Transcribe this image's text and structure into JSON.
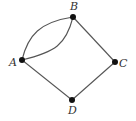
{
  "graph": {
    "nodes": [
      {
        "id": "A",
        "label": "A",
        "x": 22,
        "y": 60,
        "label_x": 9,
        "label_y": 66
      },
      {
        "id": "B",
        "label": "B",
        "x": 73,
        "y": 17,
        "label_x": 70,
        "label_y": 10
      },
      {
        "id": "C",
        "label": "C",
        "x": 115,
        "y": 62,
        "label_x": 119,
        "label_y": 67
      },
      {
        "id": "D",
        "label": "D",
        "x": 72,
        "y": 100,
        "label_x": 68,
        "label_y": 114
      }
    ],
    "edges": [
      {
        "from": "A",
        "to": "B",
        "type": "curved-upper"
      },
      {
        "from": "A",
        "to": "B",
        "type": "curved-lower"
      },
      {
        "from": "B",
        "to": "C",
        "type": "straight"
      },
      {
        "from": "C",
        "to": "D",
        "type": "straight"
      },
      {
        "from": "D",
        "to": "A",
        "type": "straight"
      }
    ]
  },
  "colors": {
    "edge": "#555555",
    "node": "#111111",
    "label": "#333333",
    "background": "#ffffff"
  }
}
